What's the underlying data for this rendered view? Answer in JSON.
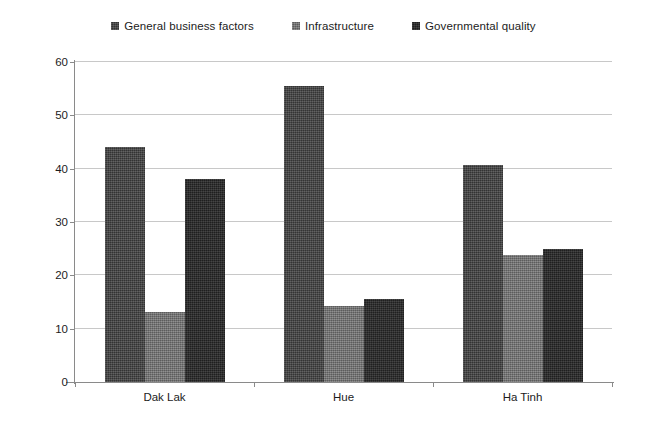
{
  "chart_data": {
    "type": "bar",
    "title": "",
    "xlabel": "",
    "ylabel": "",
    "categories": [
      "Dak Lak",
      "Hue",
      "Ha Tinh"
    ],
    "series": [
      {
        "name": "General business factors",
        "color": "#3f3f3f",
        "values": [
          44.0,
          55.5,
          40.7
        ]
      },
      {
        "name": "Infrastructure",
        "color": "#707070",
        "values": [
          13.2,
          14.3,
          23.8
        ]
      },
      {
        "name": "Governmental quality",
        "color": "#262626",
        "values": [
          38.0,
          15.5,
          25.0
        ]
      }
    ],
    "ylim": [
      0,
      60
    ],
    "yticks": [
      0,
      10,
      20,
      30,
      40,
      50,
      60
    ],
    "ytick_labels": [
      "0",
      "10",
      "20",
      "30",
      "40",
      "50",
      "60"
    ],
    "grid": true,
    "legend_position": "top-center",
    "legend_marker": "square-swatch"
  }
}
